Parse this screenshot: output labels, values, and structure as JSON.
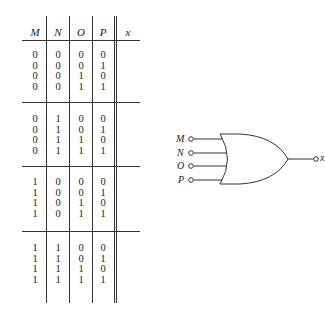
{
  "truth_table": {
    "headers": [
      "M",
      "N",
      "O",
      "P",
      "x"
    ],
    "groups": [
      {
        "rows": [
          [
            "0",
            "0",
            "0",
            "0"
          ],
          [
            "0",
            "0",
            "0",
            "1"
          ],
          [
            "0",
            "0",
            "1",
            "0"
          ],
          [
            "0",
            "0",
            "1",
            "1"
          ]
        ]
      },
      {
        "rows": [
          [
            "0",
            "1",
            "0",
            "0"
          ],
          [
            "0",
            "1",
            "0",
            "1"
          ],
          [
            "0",
            "1",
            "1",
            "0"
          ],
          [
            "0",
            "1",
            "1",
            "1"
          ]
        ]
      },
      {
        "rows": [
          [
            "1",
            "0",
            "0",
            "0"
          ],
          [
            "1",
            "0",
            "0",
            "1"
          ],
          [
            "1",
            "0",
            "1",
            "0"
          ],
          [
            "1",
            "0",
            "1",
            "1"
          ]
        ]
      },
      {
        "rows": [
          [
            "1",
            "1",
            "0",
            "0"
          ],
          [
            "1",
            "1",
            "0",
            "1"
          ],
          [
            "1",
            "1",
            "1",
            "0"
          ],
          [
            "1",
            "1",
            "1",
            "1"
          ]
        ]
      }
    ],
    "output_column_values": []
  },
  "gate": {
    "type": "OR",
    "inputs": [
      "M",
      "N",
      "O",
      "P"
    ],
    "output": "x"
  }
}
